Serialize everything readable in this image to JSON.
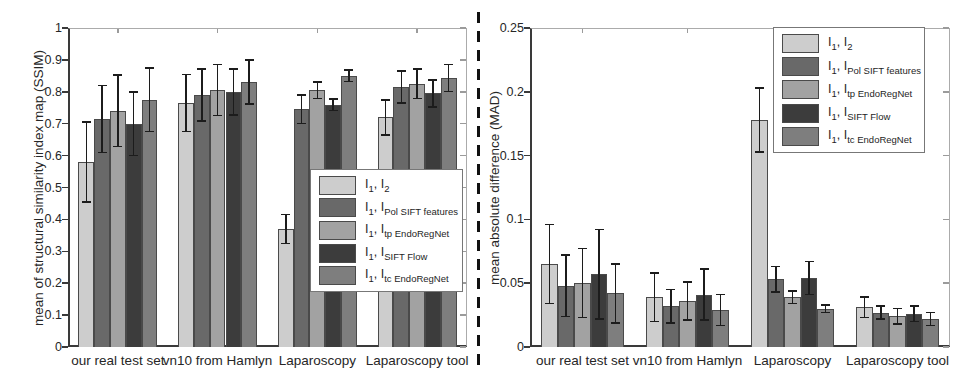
{
  "figure": {
    "background": "#ffffff",
    "divider_color": "#111111",
    "axis_color": "#3a3a3a",
    "box_color": "#ababab",
    "error_bar_color": "#1c1c1c"
  },
  "chart_data": [
    {
      "type": "bar",
      "title": "",
      "xlabel": "",
      "ylabel": "mean of structural similarity index map (SSIM)",
      "ylim": [
        0,
        1
      ],
      "ytick_labels": [
        "0",
        "0.1",
        "0.2",
        "0.3",
        "0.4",
        "0.5",
        "0.6",
        "0.7",
        "0.8",
        "0.9",
        "1"
      ],
      "grid": false,
      "error_bars": true,
      "legend_position": "inside lower-right",
      "categories": [
        "our real test set",
        "vn10 from Hamlyn",
        "Laparoscopy",
        "Laparoscopy tool"
      ],
      "series": [
        {
          "name": "I1, I2",
          "legend_sub": "2",
          "color": "#cdcdcd",
          "values": [
            0.58,
            0.765,
            0.37,
            0.72
          ],
          "errors": [
            0.125,
            0.09,
            0.045,
            0.055
          ]
        },
        {
          "name": "I1, IPol SIFT features",
          "legend_sub": "Pol SIFT features",
          "color": "#696969",
          "values": [
            0.715,
            0.79,
            0.745,
            0.815
          ],
          "errors": [
            0.105,
            0.082,
            0.045,
            0.05
          ]
        },
        {
          "name": "I1, Itp EndoRegNet",
          "legend_sub": "tp EndoRegNet",
          "color": "#a2a2a2",
          "values": [
            0.74,
            0.805,
            0.805,
            0.825
          ],
          "errors": [
            0.112,
            0.08,
            0.026,
            0.046
          ]
        },
        {
          "name": "I1, ISIFT Flow",
          "legend_sub": "SIFT Flow",
          "color": "#3c3c3c",
          "values": [
            0.7,
            0.8,
            0.76,
            0.795
          ],
          "errors": [
            0.1,
            0.072,
            0.018,
            0.042
          ]
        },
        {
          "name": "I1, Itc EndoRegNet",
          "legend_sub": "tc EndoRegNet",
          "color": "#7e7e7e",
          "values": [
            0.775,
            0.83,
            0.85,
            0.843
          ],
          "errors": [
            0.1,
            0.069,
            0.018,
            0.042
          ]
        }
      ]
    },
    {
      "type": "bar",
      "title": "",
      "xlabel": "",
      "ylabel": "mean absolute difference (MAD)",
      "ylim": [
        0,
        0.25
      ],
      "ytick_labels": [
        "0",
        "0.05",
        "0.1",
        "0.15",
        "0.2",
        "0.25"
      ],
      "grid": false,
      "error_bars": true,
      "legend_position": "inside upper-right",
      "categories": [
        "our real test set",
        "vn10 from Hamlyn",
        "Laparoscopy",
        "Laparoscopy tool"
      ],
      "series": [
        {
          "name": "I1, I2",
          "legend_sub": "2",
          "color": "#cdcdcd",
          "values": [
            0.065,
            0.039,
            0.178,
            0.031
          ],
          "errors": [
            0.031,
            0.019,
            0.025,
            0.008
          ]
        },
        {
          "name": "I1, IPol SIFT features",
          "legend_sub": "Pol SIFT features",
          "color": "#696969",
          "values": [
            0.048,
            0.032,
            0.053,
            0.027
          ],
          "errors": [
            0.024,
            0.013,
            0.01,
            0.005
          ]
        },
        {
          "name": "I1, Itp EndoRegNet",
          "legend_sub": "tp EndoRegNet",
          "color": "#a2a2a2",
          "values": [
            0.05,
            0.036,
            0.039,
            0.024
          ],
          "errors": [
            0.027,
            0.015,
            0.005,
            0.006
          ]
        },
        {
          "name": "I1, ISIFT Flow",
          "legend_sub": "SIFT Flow",
          "color": "#3c3c3c",
          "values": [
            0.057,
            0.041,
            0.054,
            0.026
          ],
          "errors": [
            0.035,
            0.02,
            0.013,
            0.006
          ]
        },
        {
          "name": "I1, Itc EndoRegNet",
          "legend_sub": "tc EndoRegNet",
          "color": "#7e7e7e",
          "values": [
            0.042,
            0.029,
            0.03,
            0.022
          ],
          "errors": [
            0.023,
            0.012,
            0.003,
            0.005
          ]
        }
      ]
    }
  ]
}
